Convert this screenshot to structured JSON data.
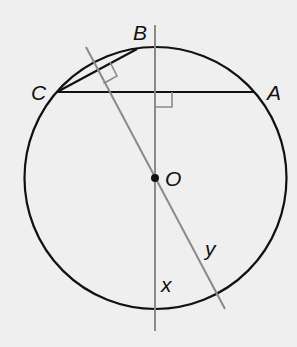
{
  "diagram": {
    "type": "circle-geometry",
    "colors": {
      "background": "#efefef",
      "circle": "#111111",
      "chord": "#111111",
      "construction_line": "#8a8a8a",
      "point": "#111111"
    },
    "circle": {
      "center_label": "O",
      "cx": 155.5,
      "cy": 178,
      "r": 131
    },
    "points": {
      "A": {
        "label": "A",
        "x": 254,
        "y": 92
      },
      "B": {
        "label": "B",
        "x": 137,
        "y": 49
      },
      "C": {
        "label": "C",
        "x": 58,
        "y": 92
      },
      "O": {
        "label": "O",
        "x": 155,
        "y": 178
      }
    },
    "chords": [
      {
        "from": "C",
        "to": "A",
        "name": "CA"
      },
      {
        "from": "C",
        "to": "B",
        "name": "CB"
      }
    ],
    "lines": [
      {
        "name": "x",
        "label": "x",
        "description": "vertical line through O perpendicular to chord CA"
      },
      {
        "name": "y",
        "label": "y",
        "description": "line through O perpendicular to chord CB"
      }
    ],
    "right_angle_marks": [
      {
        "at": "intersection of line x and chord CA"
      },
      {
        "at": "intersection of line y and chord CB"
      }
    ]
  }
}
